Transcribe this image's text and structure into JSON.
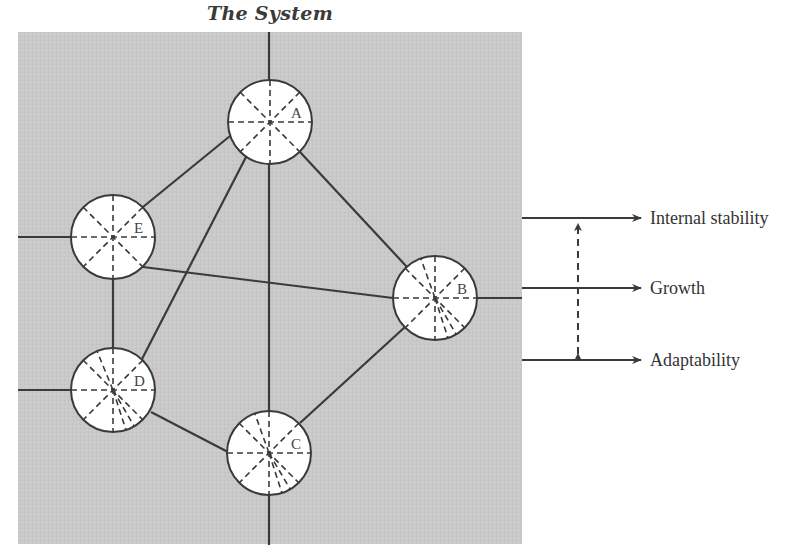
{
  "title": "The System",
  "colors": {
    "background_panel": "#c9c9c9",
    "line": "#3a3a3a",
    "node_fill": "#ffffff"
  },
  "nodes": [
    {
      "id": "A",
      "label": "A",
      "cx": 270,
      "cy": 122,
      "r": 42
    },
    {
      "id": "B",
      "label": "B",
      "cx": 435,
      "cy": 298,
      "r": 42
    },
    {
      "id": "C",
      "label": "C",
      "cx": 269,
      "cy": 453,
      "r": 42
    },
    {
      "id": "D",
      "label": "D",
      "cx": 113,
      "cy": 390,
      "r": 42
    },
    {
      "id": "E",
      "label": "E",
      "cx": 113,
      "cy": 237,
      "r": 42
    }
  ],
  "edges": [
    {
      "from": "E",
      "to": "A"
    },
    {
      "from": "A",
      "to": "D"
    },
    {
      "from": "A",
      "to": "B"
    },
    {
      "from": "E",
      "to": "B"
    },
    {
      "from": "E",
      "to": "D"
    },
    {
      "from": "D",
      "to": "C"
    },
    {
      "from": "C",
      "to": "B"
    },
    {
      "from": "A",
      "to": "C"
    }
  ],
  "outputs": [
    {
      "label": "Internal stability",
      "y": 218
    },
    {
      "label": "Growth",
      "y": 288
    },
    {
      "label": "Adaptability",
      "y": 360
    }
  ],
  "tradeoff_arrow": {
    "style": "dashed",
    "direction": "bidirectional",
    "between": [
      "Internal stability",
      "Adaptability"
    ]
  }
}
